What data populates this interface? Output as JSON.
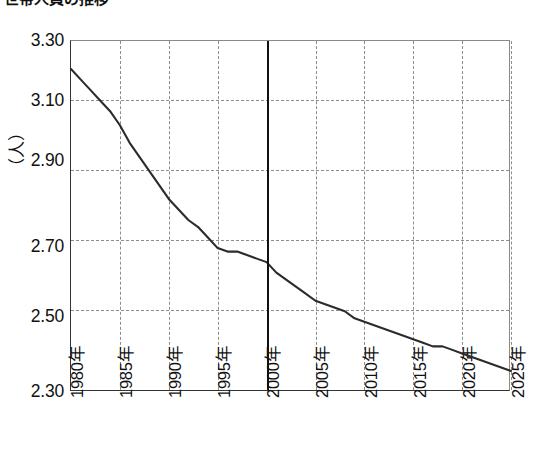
{
  "title": "世帯人員の推移",
  "axis": {
    "y_unit_label": "（人）",
    "y_ticks": [
      "3.30",
      "3.10",
      "2.90",
      "2.70",
      "2.50",
      "2.30"
    ],
    "x_ticks": [
      "1980年",
      "1985年",
      "1990年",
      "1995年",
      "2000年",
      "2005年",
      "2010年",
      "2015年",
      "2020年",
      "2025年"
    ]
  },
  "marker": {
    "year": "2000年",
    "color": "#111111"
  },
  "colors": {
    "series_line": "#2b2b2b",
    "grid": "#8d8d8d",
    "axis": "#333333",
    "text": "#111111"
  },
  "chart_data": {
    "type": "line",
    "title": "世帯人員の推移",
    "xlabel": "",
    "ylabel": "（人）",
    "ylim": [
      2.3,
      3.3
    ],
    "xlim": [
      1980,
      2025
    ],
    "grid": true,
    "legend": "none",
    "y_tick_values": [
      3.3,
      3.1,
      2.9,
      2.7,
      2.5,
      2.3
    ],
    "x_tick_values": [
      1980,
      1985,
      1990,
      1995,
      2000,
      2005,
      2010,
      2015,
      2020,
      2025
    ],
    "x": [
      1980,
      1981,
      1982,
      1983,
      1984,
      1985,
      1986,
      1987,
      1988,
      1989,
      1990,
      1991,
      1992,
      1993,
      1994,
      1995,
      1996,
      1997,
      1998,
      1999,
      2000,
      2001,
      2002,
      2003,
      2004,
      2005,
      2006,
      2007,
      2008,
      2009,
      2010,
      2011,
      2012,
      2013,
      2014,
      2015,
      2016,
      2017,
      2018,
      2019,
      2020,
      2021,
      2022,
      2023,
      2024,
      2025
    ],
    "series": [
      {
        "name": "平均世帯人員",
        "values": [
          3.22,
          3.19,
          3.16,
          3.13,
          3.1,
          3.06,
          3.01,
          2.97,
          2.93,
          2.89,
          2.85,
          2.82,
          2.79,
          2.77,
          2.74,
          2.71,
          2.7,
          2.7,
          2.69,
          2.68,
          2.67,
          2.64,
          2.62,
          2.6,
          2.58,
          2.56,
          2.55,
          2.54,
          2.53,
          2.51,
          2.5,
          2.49,
          2.48,
          2.47,
          2.46,
          2.45,
          2.44,
          2.43,
          2.43,
          2.42,
          2.41,
          2.4,
          2.39,
          2.38,
          2.37,
          2.36
        ]
      }
    ],
    "annotations": [
      {
        "type": "vline",
        "x": 2000,
        "label": "2000年",
        "style": "solid-bold"
      }
    ]
  }
}
